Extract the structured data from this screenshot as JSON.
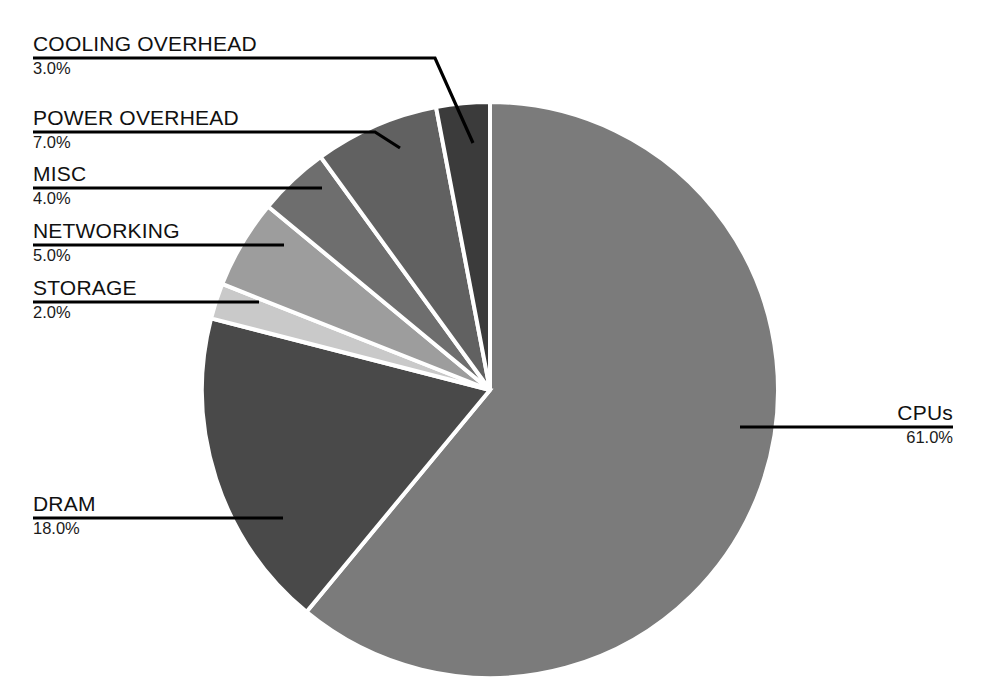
{
  "chart_data": {
    "type": "pie",
    "title": "",
    "subtitle": "",
    "xlabel": "",
    "ylabel": "",
    "legend_position": "callout-labels",
    "grid": false,
    "units": "percent",
    "start_angle_deg": 0,
    "direction": "clockwise",
    "categories": [
      "CPUs",
      "DRAM",
      "STORAGE",
      "NETWORKING",
      "MISC",
      "POWER OVERHEAD",
      "COOLING OVERHEAD"
    ],
    "values": [
      61.0,
      18.0,
      2.0,
      5.0,
      4.0,
      7.0,
      3.0
    ],
    "labels": [
      "61.0%",
      "18.0%",
      "2.0%",
      "5.0%",
      "4.0%",
      "7.0%",
      "3.0%"
    ],
    "colors": [
      "#7b7b7b",
      "#494949",
      "#c9c9c9",
      "#9d9d9d",
      "#6e6e6e",
      "#616161",
      "#3b3b3b"
    ],
    "slices": [
      {
        "name": "CPUs",
        "value": 61.0,
        "label": "61.0%",
        "color": "#7b7b7b"
      },
      {
        "name": "DRAM",
        "value": 18.0,
        "label": "18.0%",
        "color": "#494949"
      },
      {
        "name": "STORAGE",
        "value": 2.0,
        "label": "2.0%",
        "color": "#c9c9c9"
      },
      {
        "name": "NETWORKING",
        "value": 5.0,
        "label": "5.0%",
        "color": "#9d9d9d"
      },
      {
        "name": "MISC",
        "value": 4.0,
        "label": "4.0%",
        "color": "#6e6e6e"
      },
      {
        "name": "POWER OVERHEAD",
        "value": 7.0,
        "label": "7.0%",
        "color": "#616161"
      },
      {
        "name": "COOLING OVERHEAD",
        "value": 3.0,
        "label": "3.0%",
        "color": "#3b3b3b"
      }
    ]
  },
  "callouts": {
    "cooling": {
      "category": "COOLING OVERHEAD",
      "percent": "3.0%"
    },
    "power": {
      "category": "POWER OVERHEAD",
      "percent": "7.0%"
    },
    "misc": {
      "category": "MISC",
      "percent": "4.0%"
    },
    "network": {
      "category": "NETWORKING",
      "percent": "5.0%"
    },
    "storage": {
      "category": "STORAGE",
      "percent": "2.0%"
    },
    "dram": {
      "category": "DRAM",
      "percent": "18.0%"
    },
    "cpus": {
      "category": "CPUs",
      "percent": "61.0%"
    }
  },
  "style": {
    "slice_separator_color": "#ffffff",
    "leader_line_color": "#000000",
    "text_color": "#111111",
    "background": "#ffffff"
  }
}
